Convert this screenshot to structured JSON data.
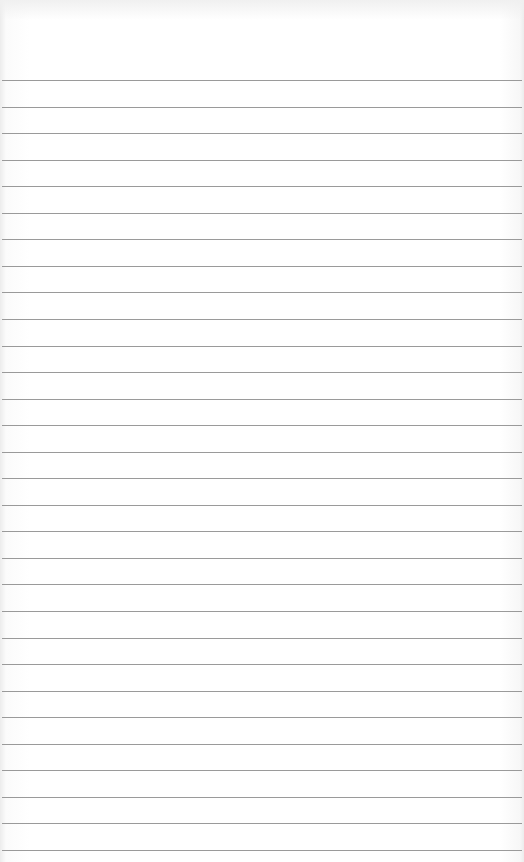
{
  "page": {
    "type": "lined-paper",
    "background_color": "#ffffff",
    "rule_color": "#9a9a9a",
    "first_rule_y": 80,
    "rule_spacing": 26.55,
    "rule_count": 30
  }
}
